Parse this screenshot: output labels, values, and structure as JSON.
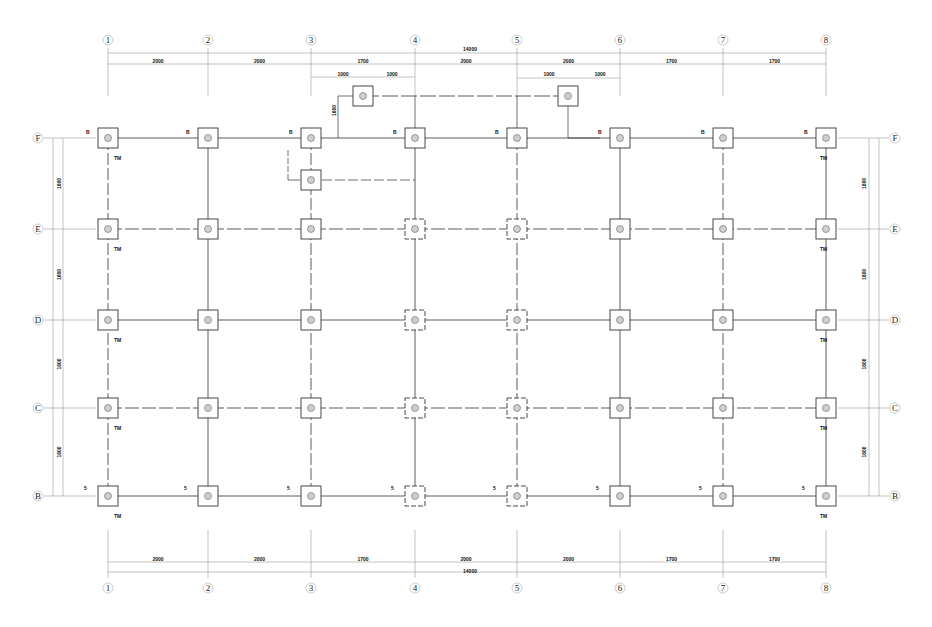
{
  "drawing": {
    "type": "foundation column grid plan",
    "line_color": "#333333",
    "grid_color": "#9a9a9a",
    "text_color": "#111111"
  },
  "grid": {
    "columns": [
      {
        "label": "1",
        "x": 108
      },
      {
        "label": "2",
        "x": 208
      },
      {
        "label": "3",
        "x": 311
      },
      {
        "label": "4",
        "x": 415
      },
      {
        "label": "5",
        "x": 517
      },
      {
        "label": "6",
        "x": 620
      },
      {
        "label": "7",
        "x": 723
      },
      {
        "label": "8",
        "x": 826
      }
    ],
    "rows": [
      {
        "label": "F",
        "y": 138
      },
      {
        "label": "E",
        "y": 229
      },
      {
        "label": "D",
        "y": 320
      },
      {
        "label": "C",
        "y": 408
      },
      {
        "label": "B",
        "y": 496
      }
    ]
  },
  "dimensions": {
    "top_total": "14000",
    "top_spans": [
      "2000",
      "2000",
      "1700",
      "2000",
      "2000",
      "1700",
      "1700"
    ],
    "top_sub_spans": [
      "1000",
      "1000",
      "1000",
      "1000"
    ],
    "bottom_spans": [
      "2000",
      "2000",
      "1700",
      "2000",
      "2000",
      "1700",
      "1700"
    ],
    "bottom_total": "14000",
    "left_spans": [
      "1600",
      "1600",
      "1600",
      "1600"
    ],
    "right_spans": [
      "1600",
      "1600",
      "1600",
      "1600"
    ],
    "beam_tags": [
      "B",
      "B",
      "B",
      "B",
      "B",
      "B",
      "B",
      "B"
    ],
    "bottom_tags": [
      "5",
      "5",
      "5",
      "5",
      "5",
      "5",
      "5",
      "5"
    ],
    "column_tags": [
      "TM",
      "TM",
      "TM",
      "TM",
      "TM"
    ]
  },
  "extra_footings": [
    {
      "x": 363,
      "y": 96
    },
    {
      "x": 568,
      "y": 96
    },
    {
      "x": 311,
      "y": 180
    }
  ]
}
